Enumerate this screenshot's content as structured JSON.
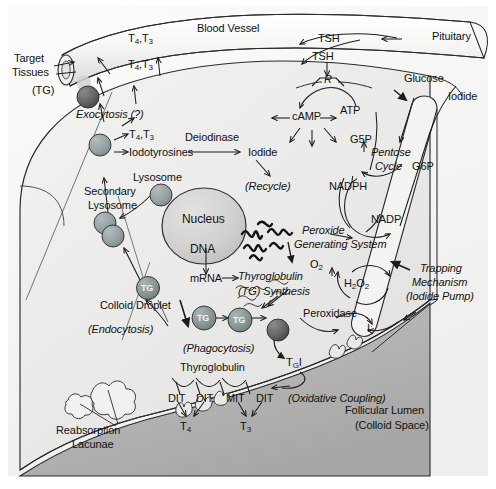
{
  "figure": {
    "domain": "biological-pathway-diagram"
  },
  "colors": {
    "background": "#ffffff",
    "cell_cytoplasm": "#ededec",
    "colloid_lumen": "#b6b6b4",
    "blood_vessel": "#f4f4f3",
    "nucleus": "#d2d2d0",
    "tg_vesicle": "#8d9a9a",
    "lysosome": "#9aa5a6",
    "stroke": "#2b2b2b",
    "text": "#111111"
  },
  "vessel": {
    "label": "Blood Vessel"
  },
  "pituitary": {
    "label": "Pituitary",
    "hormone_in_vessel": "TSH",
    "hormone_at_cell": "TSH",
    "receptor": "R"
  },
  "target": {
    "line1": "Target",
    "line2": "Tissues",
    "line3": "(TG)"
  },
  "hormones": {
    "t4": "T",
    "t4_sub": "4",
    "t3": "T",
    "t3_sub": "3",
    "vessel_pair": "T4, T3",
    "cell_pair": "T4, T3",
    "exit_pair": "T4, T3"
  },
  "secretion": {
    "exocytosis": "Exocytosis (?)",
    "iodotyrosines": "Iodotyrosines",
    "deiodinase": "Deiodinase",
    "iodide": "Iodide",
    "recycle": "(Recycle)"
  },
  "organelles": {
    "lysosome": "Lysosome",
    "secondary_lysosome_l1": "Secondary",
    "secondary_lysosome_l2": "Lysosome",
    "nucleus": "Nucleus",
    "dna": "DNA",
    "mrna": "mRNA",
    "colloid_droplet": "Colloid Droplet",
    "endocytosis": "(Endocytosis)",
    "phagocytosis": "(Phagocytosis)"
  },
  "synthesis": {
    "tg_label": "TG",
    "thyroglobulin_l1": "Thyroglobulin",
    "thyroglobulin_l2": "(TG) Synthesis"
  },
  "signaling": {
    "camp": "cAMP",
    "atp": "ATP"
  },
  "pentose": {
    "glucose": "Glucose",
    "g5p": "G5P",
    "g6p": "G6P",
    "cycle_l1": "Pentose",
    "cycle_l2": "Cycle",
    "nadph": "NADPH",
    "nadp": "NADP"
  },
  "peroxide": {
    "system_l1": "Peroxide",
    "system_l2": "Generating System",
    "o2": "O",
    "o2_sub": "2",
    "h2o2_a": "H",
    "h2o2_sub1": "2",
    "h2o2_b": "O",
    "h2o2_sub2": "2",
    "peroxidase": "Peroxidase"
  },
  "iodide_transport": {
    "iodide": "Iodide",
    "trapping_l1": "Trapping",
    "trapping_l2": "Mechanism",
    "trapping_l3": "(Iodide Pump)",
    "iodine_radical": "I",
    "iodine_sup": "·"
  },
  "lumen": {
    "tgi_main": "T",
    "tgi_sub": "G",
    "tgi_tail": "I",
    "thyroglobulin": "Thyroglobulin",
    "residues": [
      "DIT",
      "DIT",
      "MIT",
      "DIT"
    ],
    "oxidative_coupling": "(Oxidative Coupling)",
    "product_t4": "T",
    "product_t4_sub": "4",
    "product_t3": "T",
    "product_t3_sub": "3",
    "follicular_l1": "Follicular Lumen",
    "follicular_l2": "(Colloid Space)"
  },
  "reabsorption": {
    "line1": "Reabsorption",
    "line2": "Lacunae"
  }
}
